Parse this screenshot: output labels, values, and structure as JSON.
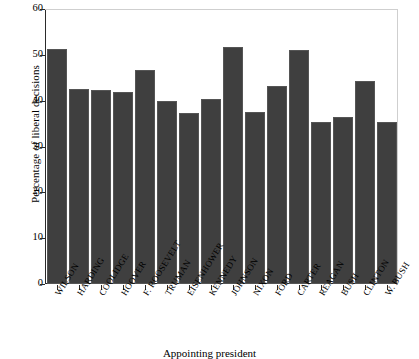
{
  "chart_data": {
    "type": "bar",
    "title": "",
    "xlabel": "Appointing president",
    "ylabel": "Percentage of liberal decisions",
    "ylim": [
      0,
      60
    ],
    "yticks": [
      0,
      10,
      20,
      30,
      40,
      50,
      60
    ],
    "grid": false,
    "legend": null,
    "bar_color": "#3f3f3f",
    "categories": [
      "WILSON",
      "HARDING",
      "COOLIDGE",
      "HOOVER",
      "F. ROOSEVELT",
      "TRUMAN",
      "EISENHOWER",
      "KENNEDY",
      "JOHNSON",
      "NIXON",
      "FORD",
      "CARTER",
      "REAGAN",
      "BUSH",
      "CLINTON",
      "W. BUSH"
    ],
    "values": [
      51.3,
      42.6,
      42.3,
      41.8,
      46.8,
      40.0,
      37.4,
      40.3,
      51.7,
      37.6,
      43.2,
      51.1,
      35.3,
      36.5,
      44.2,
      35.3
    ]
  },
  "axes": {
    "y_tick_labels": [
      "60",
      "50",
      "40",
      "30",
      "20",
      "10",
      "0"
    ],
    "y_title": "Percentage of liberal decisions",
    "x_title": "Appointing president"
  }
}
